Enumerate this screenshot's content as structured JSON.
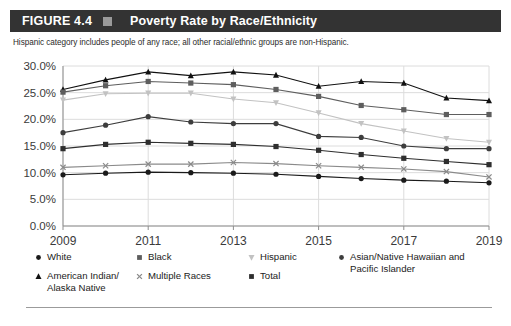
{
  "header": {
    "figure_label": "FIGURE 4.4",
    "separator_icon": "square-bullet-icon",
    "title": "Poverty Rate by Race/Ethnicity"
  },
  "subtitle": "Hispanic category includes people of any race; all other racial/ethnic groups are non-Hispanic.",
  "legend": [
    {
      "label": "White",
      "marker": "circle",
      "color": "#1a1a1a"
    },
    {
      "label": "Black",
      "marker": "square",
      "color": "#5e5e5e"
    },
    {
      "label": "Hispanic",
      "marker": "triangle-down",
      "color": "#c2c2c2"
    },
    {
      "label": "Asian/Native Hawaiian and\nPacific Islander",
      "marker": "circle",
      "color": "#3d3d3d"
    },
    {
      "label": "American Indian/\nAlaska Native",
      "marker": "triangle-up",
      "color": "#111111"
    },
    {
      "label": "Multiple Races",
      "marker": "cross",
      "color": "#8a8a8a"
    },
    {
      "label": "Total",
      "marker": "square",
      "color": "#2e2e2e"
    }
  ],
  "chart_data": {
    "type": "line",
    "title": "Poverty Rate by Race/Ethnicity",
    "subtitle": "Hispanic category includes people of any race; all other racial/ethnic groups are non-Hispanic.",
    "xlabel": "",
    "ylabel": "",
    "x": [
      2009,
      2010,
      2011,
      2012,
      2013,
      2014,
      2015,
      2016,
      2017,
      2018,
      2019
    ],
    "xtick_labels": [
      "2009",
      "2011",
      "2013",
      "2015",
      "2017",
      "2019"
    ],
    "xtick_values": [
      2009,
      2011,
      2013,
      2015,
      2017,
      2019
    ],
    "ytick_labels": [
      "0.0%",
      "5.0%",
      "10.0%",
      "15.0%",
      "20.0%",
      "25.0%",
      "30.0%"
    ],
    "ylim": [
      0,
      30
    ],
    "ytick_values": [
      0,
      5,
      10,
      15,
      20,
      25,
      30
    ],
    "grid": true,
    "legend_position": "below",
    "series": [
      {
        "name": "American Indian/Alaska Native",
        "marker": "triangle-up",
        "color": "#111111",
        "values": [
          25.6,
          27.4,
          28.9,
          28.2,
          28.9,
          28.3,
          26.2,
          27.1,
          26.8,
          24.0,
          23.5
        ]
      },
      {
        "name": "Black",
        "marker": "square",
        "color": "#5e5e5e",
        "values": [
          25.1,
          26.3,
          27.1,
          26.8,
          26.5,
          25.6,
          24.3,
          22.6,
          21.8,
          20.9,
          20.9
        ]
      },
      {
        "name": "Hispanic",
        "marker": "triangle-down",
        "color": "#c2c2c2",
        "values": [
          23.6,
          24.8,
          24.9,
          24.9,
          23.8,
          23.1,
          21.2,
          19.2,
          17.8,
          16.4,
          15.7
        ]
      },
      {
        "name": "Asian/Native Hawaiian and Pacific Islander",
        "marker": "circle",
        "color": "#3d3d3d",
        "values": [
          17.5,
          18.9,
          20.5,
          19.5,
          19.2,
          19.2,
          16.8,
          16.6,
          15.0,
          14.5,
          14.5
        ]
      },
      {
        "name": "Total",
        "marker": "square",
        "color": "#2e2e2e",
        "values": [
          14.5,
          15.3,
          15.7,
          15.5,
          15.3,
          14.9,
          14.2,
          13.4,
          12.7,
          12.1,
          11.5
        ]
      },
      {
        "name": "Multiple Races",
        "marker": "cross",
        "color": "#8a8a8a",
        "values": [
          11.0,
          11.3,
          11.6,
          11.6,
          11.9,
          11.7,
          11.3,
          11.0,
          10.7,
          10.2,
          9.2
        ]
      },
      {
        "name": "White",
        "marker": "circle",
        "color": "#1a1a1a",
        "values": [
          9.6,
          9.9,
          10.1,
          10.0,
          9.9,
          9.7,
          9.3,
          8.9,
          8.6,
          8.4,
          8.1
        ]
      }
    ]
  }
}
